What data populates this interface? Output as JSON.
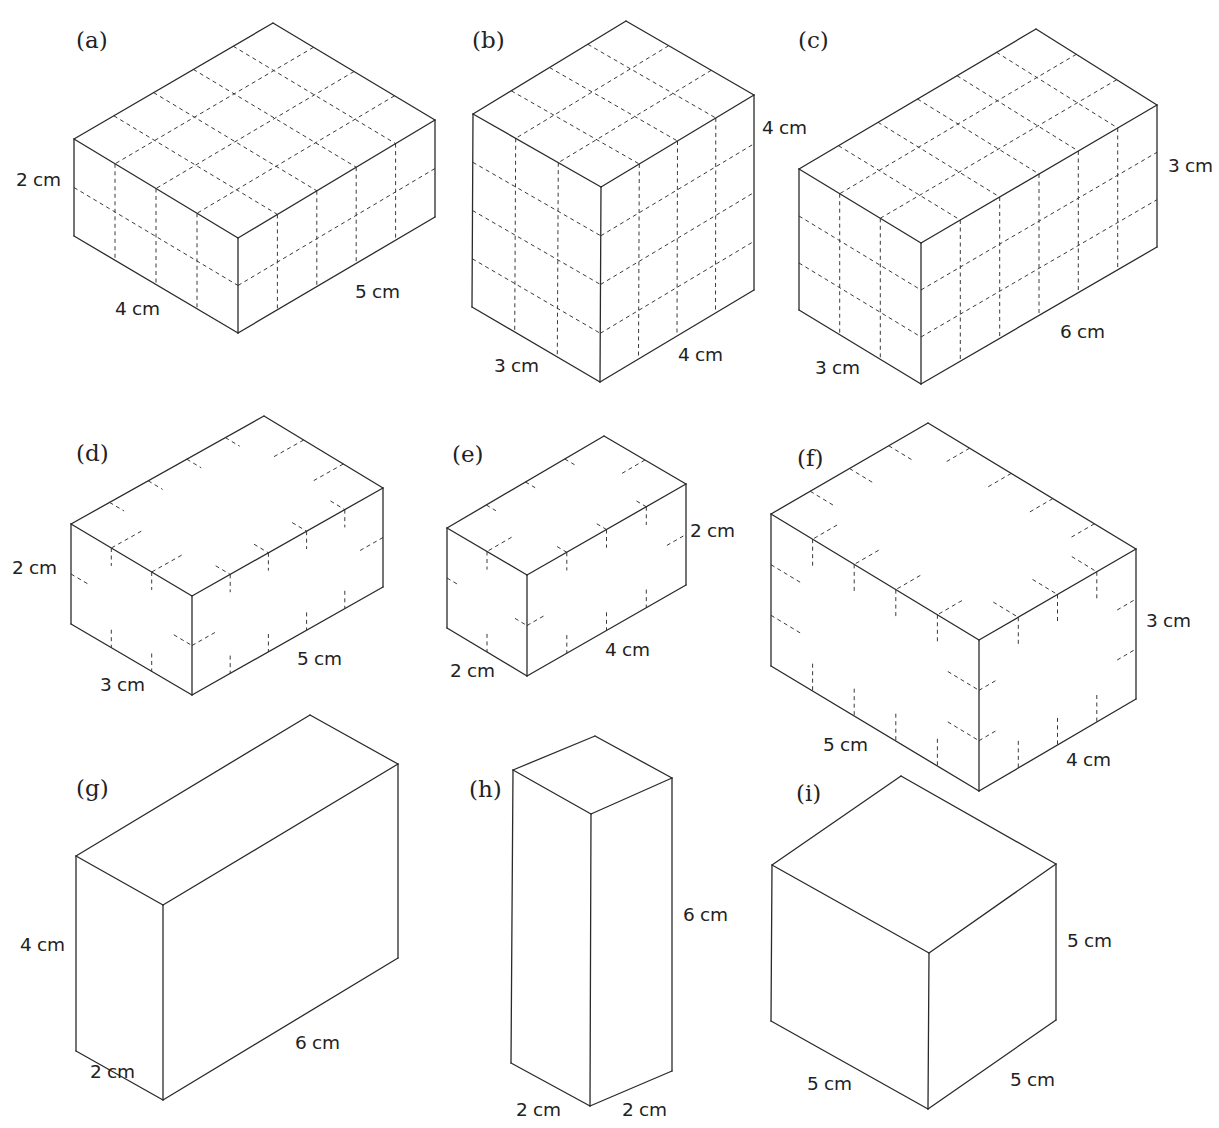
{
  "page": {
    "header_fragment": ""
  },
  "figures": [
    {
      "id": "a",
      "label": "(a)",
      "label_pos": [
        76,
        48
      ],
      "grid": "full",
      "dims": {
        "left": 4,
        "right": 5,
        "height": 2
      },
      "v": {
        "T": [
          273,
          23
        ],
        "L": [
          74,
          139
        ],
        "R": [
          435,
          120
        ],
        "F": [
          238,
          238
        ],
        "BL": [
          74,
          236
        ],
        "BF": [
          238,
          333
        ],
        "BR": [
          435,
          217
        ]
      },
      "texts": [
        {
          "role": "height",
          "text": "2 cm",
          "pos": [
            16,
            186
          ]
        },
        {
          "role": "left",
          "text": "4 cm",
          "pos": [
            115,
            315
          ]
        },
        {
          "role": "right",
          "text": "5 cm",
          "pos": [
            355,
            298
          ]
        }
      ]
    },
    {
      "id": "b",
      "label": "(b)",
      "label_pos": [
        472,
        48
      ],
      "grid": "full",
      "dims": {
        "left": 3,
        "right": 4,
        "height": 4
      },
      "v": {
        "T": [
          626,
          21
        ],
        "L": [
          473,
          114
        ],
        "R": [
          754,
          95
        ],
        "F": [
          601,
          187
        ],
        "BL": [
          472,
          307
        ],
        "BF": [
          600,
          382
        ],
        "BR": [
          754,
          290
        ]
      },
      "texts": [
        {
          "role": "height",
          "text": "4 cm",
          "pos": [
            762,
            134
          ]
        },
        {
          "role": "left",
          "text": "3 cm",
          "pos": [
            494,
            372
          ]
        },
        {
          "role": "right",
          "text": "4 cm",
          "pos": [
            678,
            361
          ]
        }
      ]
    },
    {
      "id": "c",
      "label": "(c)",
      "label_pos": [
        798,
        48
      ],
      "grid": "full",
      "dims": {
        "left": 3,
        "right": 6,
        "height": 3
      },
      "v": {
        "T": [
          1036,
          29
        ],
        "L": [
          799,
          169
        ],
        "R": [
          1157,
          105
        ],
        "F": [
          921,
          243
        ],
        "BL": [
          799,
          310
        ],
        "BF": [
          921,
          384
        ],
        "BR": [
          1157,
          247
        ]
      },
      "texts": [
        {
          "role": "height",
          "text": "3 cm",
          "pos": [
            1168,
            172
          ]
        },
        {
          "role": "left",
          "text": "3 cm",
          "pos": [
            815,
            374
          ]
        },
        {
          "role": "right",
          "text": "6 cm",
          "pos": [
            1060,
            338
          ]
        }
      ]
    },
    {
      "id": "d",
      "label": "(d)",
      "label_pos": [
        76,
        461
      ],
      "grid": "ticks",
      "dims": {
        "left": 3,
        "right": 5,
        "height": 2
      },
      "v": {
        "T": [
          264,
          416
        ],
        "L": [
          71,
          524
        ],
        "R": [
          383,
          488
        ],
        "F": [
          192,
          596
        ],
        "BL": [
          71,
          624
        ],
        "BF": [
          192,
          695
        ],
        "BR": [
          383,
          587
        ]
      },
      "texts": [
        {
          "role": "height",
          "text": "2 cm",
          "pos": [
            12,
            574
          ]
        },
        {
          "role": "left",
          "text": "3 cm",
          "pos": [
            100,
            691
          ]
        },
        {
          "role": "right",
          "text": "5 cm",
          "pos": [
            297,
            665
          ]
        }
      ]
    },
    {
      "id": "e",
      "label": "(e)",
      "label_pos": [
        452,
        462
      ],
      "grid": "ticks",
      "dims": {
        "left": 2,
        "right": 4,
        "height": 2
      },
      "v": {
        "T": [
          604,
          436
        ],
        "L": [
          447,
          528
        ],
        "R": [
          686,
          484
        ],
        "F": [
          527,
          575
        ],
        "BL": [
          447,
          628
        ],
        "BF": [
          527,
          676
        ],
        "BR": [
          686,
          585
        ]
      },
      "texts": [
        {
          "role": "height",
          "text": "2 cm",
          "pos": [
            690,
            537
          ]
        },
        {
          "role": "left",
          "text": "2 cm",
          "pos": [
            450,
            677
          ]
        },
        {
          "role": "right",
          "text": "4 cm",
          "pos": [
            605,
            656
          ]
        }
      ]
    },
    {
      "id": "f",
      "label": "(f)",
      "label_pos": [
        797,
        466
      ],
      "grid": "ticks",
      "dims": {
        "left": 5,
        "right": 4,
        "height": 3
      },
      "v": {
        "T": [
          928,
          423
        ],
        "L": [
          771,
          514
        ],
        "R": [
          1136,
          549
        ],
        "F": [
          979,
          640
        ],
        "BL": [
          771,
          666
        ],
        "BF": [
          979,
          791
        ],
        "BR": [
          1136,
          699
        ]
      },
      "texts": [
        {
          "role": "height",
          "text": "3 cm",
          "pos": [
            1146,
            627
          ]
        },
        {
          "role": "left",
          "text": "5 cm",
          "pos": [
            823,
            751
          ]
        },
        {
          "role": "right",
          "text": "4 cm",
          "pos": [
            1066,
            766
          ]
        }
      ]
    },
    {
      "id": "g",
      "label": "(g)",
      "label_pos": [
        76,
        796
      ],
      "grid": "none",
      "dims": {
        "left": 2,
        "right": 6,
        "height": 4
      },
      "v": {
        "T": [
          310,
          715
        ],
        "L": [
          76,
          856
        ],
        "R": [
          398,
          764
        ],
        "F": [
          163,
          905
        ],
        "BL": [
          76,
          1051
        ],
        "BF": [
          163,
          1100
        ],
        "BR": [
          398,
          958
        ]
      },
      "texts": [
        {
          "role": "height",
          "text": "4 cm",
          "pos": [
            20,
            951
          ]
        },
        {
          "role": "left",
          "text": "2 cm",
          "pos": [
            90,
            1078
          ]
        },
        {
          "role": "right",
          "text": "6 cm",
          "pos": [
            295,
            1049
          ]
        }
      ]
    },
    {
      "id": "h",
      "label": "(h)",
      "label_pos": [
        469,
        797
      ],
      "grid": "none",
      "dims": {
        "left": 2,
        "right": 2,
        "height": 6
      },
      "v": {
        "T": [
          595,
          736
        ],
        "L": [
          513,
          770
        ],
        "R": [
          672,
          778
        ],
        "F": [
          591,
          814
        ],
        "BL": [
          511,
          1063
        ],
        "BF": [
          590,
          1106
        ],
        "BR": [
          672,
          1071
        ]
      },
      "texts": [
        {
          "role": "height",
          "text": "6 cm",
          "pos": [
            683,
            921
          ]
        },
        {
          "role": "left",
          "text": "2 cm",
          "pos": [
            516,
            1116
          ]
        },
        {
          "role": "right",
          "text": "2 cm",
          "pos": [
            622,
            1116
          ]
        }
      ]
    },
    {
      "id": "i",
      "label": "(i)",
      "label_pos": [
        796,
        801
      ],
      "grid": "none",
      "dims": {
        "left": 5,
        "right": 5,
        "height": 5
      },
      "v": {
        "T": [
          901,
          776
        ],
        "L": [
          772,
          865
        ],
        "R": [
          1056,
          864
        ],
        "F": [
          929,
          953
        ],
        "BL": [
          771,
          1021
        ],
        "BF": [
          928,
          1109
        ],
        "BR": [
          1056,
          1020
        ]
      },
      "texts": [
        {
          "role": "height",
          "text": "5 cm",
          "pos": [
            1067,
            947
          ]
        },
        {
          "role": "left",
          "text": "5 cm",
          "pos": [
            807,
            1090
          ]
        },
        {
          "role": "right",
          "text": "5 cm",
          "pos": [
            1010,
            1086
          ]
        }
      ]
    }
  ]
}
